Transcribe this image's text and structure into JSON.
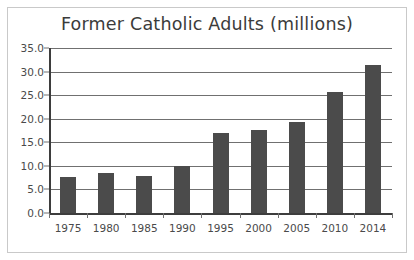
{
  "chart_data": {
    "type": "bar",
    "title": "Former Catholic Adults (millions)",
    "xlabel": "",
    "ylabel": "",
    "categories": [
      "1975",
      "1980",
      "1985",
      "1990",
      "1995",
      "2000",
      "2005",
      "2010",
      "2014"
    ],
    "values": [
      7.7,
      8.4,
      7.9,
      10.0,
      17.0,
      17.7,
      19.3,
      25.7,
      31.3
    ],
    "ylim": [
      0.0,
      35.0
    ],
    "ytick_labels": [
      "0.0",
      "5.0",
      "10.0",
      "15.0",
      "20.0",
      "25.0",
      "30.0",
      "35.0"
    ],
    "ytick_values": [
      0.0,
      5.0,
      10.0,
      15.0,
      20.0,
      25.0,
      30.0,
      35.0
    ],
    "grid": "horizontal",
    "legend": "none",
    "bar_color": "#4b4b4b",
    "grid_color": "#707070",
    "axis_color": "#3d3d3d",
    "background_color": "#ffffff",
    "border_color": "#c9c9c9"
  }
}
